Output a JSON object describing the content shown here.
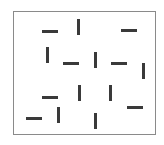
{
  "stimulus": {
    "frame": {
      "left": 13,
      "top": 11,
      "width": 143,
      "height": 124,
      "border_color": "#8a8a8a"
    },
    "bar_color": "#3a3a3a",
    "bar_length": 16,
    "bar_thickness": 3,
    "bars": [
      {
        "orientation": "horizontal",
        "x": 42,
        "y": 30
      },
      {
        "orientation": "vertical",
        "x": 77,
        "y": 19
      },
      {
        "orientation": "horizontal",
        "x": 121,
        "y": 29
      },
      {
        "orientation": "vertical",
        "x": 46,
        "y": 47
      },
      {
        "orientation": "horizontal",
        "x": 63,
        "y": 62
      },
      {
        "orientation": "vertical",
        "x": 94,
        "y": 52
      },
      {
        "orientation": "horizontal",
        "x": 111,
        "y": 62
      },
      {
        "orientation": "vertical",
        "x": 142,
        "y": 63
      },
      {
        "orientation": "horizontal",
        "x": 42,
        "y": 96
      },
      {
        "orientation": "vertical",
        "x": 78,
        "y": 85
      },
      {
        "orientation": "vertical",
        "x": 109,
        "y": 85
      },
      {
        "orientation": "horizontal",
        "x": 127,
        "y": 106
      },
      {
        "orientation": "horizontal",
        "x": 26,
        "y": 117
      },
      {
        "orientation": "vertical",
        "x": 57,
        "y": 107
      },
      {
        "orientation": "vertical",
        "x": 94,
        "y": 113
      }
    ]
  }
}
